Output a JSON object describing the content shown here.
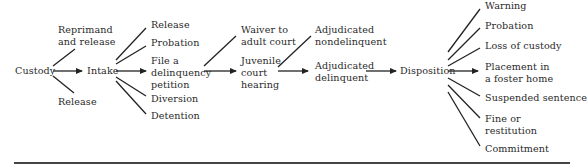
{
  "diagram": {
    "type": "juvenile-justice-flowchart",
    "nodes": {
      "custody": "Custody",
      "reprimand": "Reprimand\nand release",
      "release_1": "Release",
      "intake": "Intake",
      "release_2": "Release",
      "probation_1": "Probation",
      "file_petition": "File a\ndelinquency\npetition",
      "diversion": "Diversion",
      "detention": "Detention",
      "waiver": "Waiver to\nadult court",
      "juvenile_hearing": "Juvenile\ncourt\nhearing",
      "adj_nondelinquent": "Adjudicated\nnondelinquent",
      "adj_delinquent": "Adjudicated\ndelinquent",
      "disposition": "Disposition",
      "warning": "Warning",
      "probation_2": "Probation",
      "loss_custody": "Loss of custody",
      "foster_home": "Placement in\na foster home",
      "suspended": "Suspended sentence",
      "fine": "Fine or\nrestitution",
      "commitment": "Commitment"
    },
    "edges": [
      [
        "custody",
        "reprimand"
      ],
      [
        "custody",
        "intake"
      ],
      [
        "custody",
        "release_1"
      ],
      [
        "intake",
        "release_2"
      ],
      [
        "intake",
        "probation_1"
      ],
      [
        "intake",
        "file_petition"
      ],
      [
        "intake",
        "diversion"
      ],
      [
        "intake",
        "detention"
      ],
      [
        "file_petition",
        "waiver"
      ],
      [
        "file_petition",
        "juvenile_hearing"
      ],
      [
        "juvenile_hearing",
        "adj_nondelinquent"
      ],
      [
        "juvenile_hearing",
        "adj_delinquent"
      ],
      [
        "adj_delinquent",
        "disposition"
      ],
      [
        "disposition",
        "warning"
      ],
      [
        "disposition",
        "probation_2"
      ],
      [
        "disposition",
        "loss_custody"
      ],
      [
        "disposition",
        "foster_home"
      ],
      [
        "disposition",
        "suspended"
      ],
      [
        "disposition",
        "fine"
      ],
      [
        "disposition",
        "commitment"
      ]
    ]
  }
}
